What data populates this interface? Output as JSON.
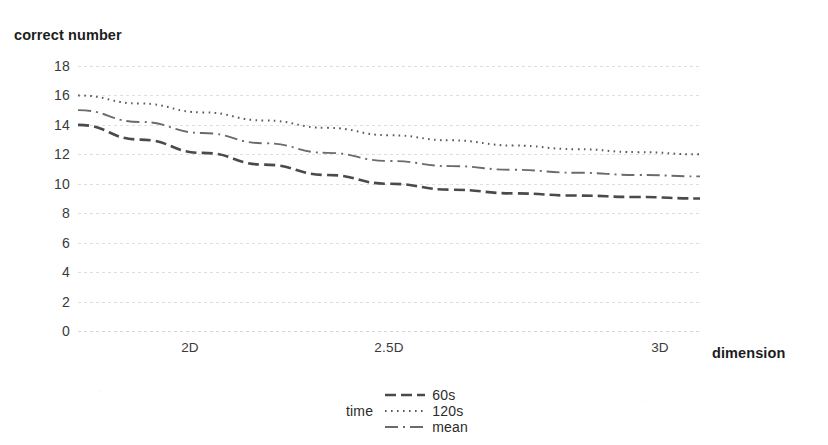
{
  "chart_data": {
    "type": "line",
    "title": "",
    "xlabel": "dimension",
    "ylabel": "correct number",
    "categories": [
      "2D",
      "2.5D",
      "3D"
    ],
    "x": [
      2,
      2.5,
      3
    ],
    "xlim": [
      2,
      3
    ],
    "ylim": [
      0,
      18
    ],
    "yticks": [
      0,
      2,
      4,
      6,
      8,
      10,
      12,
      14,
      16,
      18
    ],
    "ytick_labels": [
      "0",
      "2",
      "4",
      "6",
      "8",
      "10",
      "12",
      "14",
      "16",
      "18"
    ],
    "xtick_labels": [
      "2D",
      "2.5D",
      "3D"
    ],
    "grid": "horizontal-dotted",
    "legend_position": "bottom-center",
    "legend_title": "time",
    "series": [
      {
        "name": "60s",
        "style": "dashed",
        "color": "#4a4a4a",
        "values": [
          14,
          10,
          9
        ],
        "points": [
          {
            "x": 2,
            "y": 14
          },
          {
            "x": 2.1,
            "y": 13.0
          },
          {
            "x": 2.2,
            "y": 12.1
          },
          {
            "x": 2.3,
            "y": 11.3
          },
          {
            "x": 2.4,
            "y": 10.6
          },
          {
            "x": 2.5,
            "y": 10.0
          },
          {
            "x": 2.6,
            "y": 9.6
          },
          {
            "x": 2.7,
            "y": 9.35
          },
          {
            "x": 2.8,
            "y": 9.2
          },
          {
            "x": 2.9,
            "y": 9.1
          },
          {
            "x": 3,
            "y": 9.0
          }
        ]
      },
      {
        "name": "120s",
        "style": "dotted",
        "color": "#5a5a5a",
        "values": [
          16,
          13.3,
          12
        ],
        "points": [
          {
            "x": 2,
            "y": 16.0
          },
          {
            "x": 2.1,
            "y": 15.45
          },
          {
            "x": 2.2,
            "y": 14.85
          },
          {
            "x": 2.3,
            "y": 14.3
          },
          {
            "x": 2.4,
            "y": 13.8
          },
          {
            "x": 2.5,
            "y": 13.3
          },
          {
            "x": 2.6,
            "y": 12.95
          },
          {
            "x": 2.7,
            "y": 12.6
          },
          {
            "x": 2.8,
            "y": 12.35
          },
          {
            "x": 2.9,
            "y": 12.15
          },
          {
            "x": 3,
            "y": 12.0
          }
        ]
      },
      {
        "name": "mean",
        "style": "dash-dot",
        "color": "#6b6b6b",
        "values": [
          15,
          11.5,
          10.5
        ],
        "points": [
          {
            "x": 2,
            "y": 15.0
          },
          {
            "x": 2.1,
            "y": 14.2
          },
          {
            "x": 2.2,
            "y": 13.45
          },
          {
            "x": 2.3,
            "y": 12.75
          },
          {
            "x": 2.4,
            "y": 12.1
          },
          {
            "x": 2.5,
            "y": 11.55
          },
          {
            "x": 2.6,
            "y": 11.2
          },
          {
            "x": 2.7,
            "y": 10.95
          },
          {
            "x": 2.8,
            "y": 10.75
          },
          {
            "x": 2.9,
            "y": 10.6
          },
          {
            "x": 3,
            "y": 10.5
          }
        ]
      }
    ]
  }
}
